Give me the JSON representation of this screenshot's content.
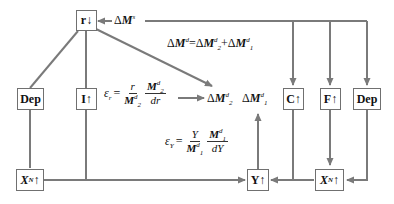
{
  "diagram": {
    "nodes": {
      "r": {
        "label": "r",
        "arrow": "↓"
      },
      "I": {
        "label": "I",
        "arrow": "↑"
      },
      "dep_left": {
        "label": "Dep"
      },
      "c": {
        "label": "C",
        "arrow": "↑"
      },
      "f": {
        "label": "F",
        "arrow": "↑"
      },
      "dep_right": {
        "label": "Dep"
      },
      "xn_left": {
        "label": "X",
        "sub": "N",
        "arrow": "↑"
      },
      "y": {
        "label": "Y",
        "arrow": "↑"
      },
      "xn_right": {
        "label": "X",
        "sub": "N",
        "arrow": "↑"
      }
    },
    "money_supply": {
      "delta": "Δ",
      "var": "M",
      "sup": "s"
    },
    "money_demand_equation": {
      "lhs_delta": "Δ",
      "lhs_var": "M",
      "lhs_sup": "d",
      "eq": "=",
      "t1_delta": "Δ",
      "t1_var": "M",
      "t1_sup": "d",
      "t1_sub": "2",
      "plus": "+",
      "t2_delta": "Δ",
      "t2_var": "M",
      "t2_sup": "d",
      "t2_sub": "1"
    },
    "demand_components": {
      "m2": {
        "delta": "Δ",
        "var": "M",
        "sup": "d",
        "sub": "2"
      },
      "m1": {
        "delta": "Δ",
        "var": "M",
        "sup": "d",
        "sub": "1"
      }
    },
    "elasticity_r": {
      "symbol": "ε",
      "sub": "r",
      "eq": "=",
      "f1_num": "r",
      "f1_den_var": "M",
      "f1_den_sup": "d",
      "f1_den_sub": "2",
      "f2_num_var": "M",
      "f2_num_sup": "d",
      "f2_num_sub": "2",
      "f2_den": "dr"
    },
    "elasticity_y": {
      "symbol": "ε",
      "sub": "Y",
      "eq": "=",
      "f1_num": "Y",
      "f1_den_var": "M",
      "f1_den_sup": "d",
      "f1_den_sub": "1",
      "f2_num_var": "M",
      "f2_num_sup": "d",
      "f2_num_sub": "1",
      "f2_den": "dY"
    },
    "colors": {
      "line": "#7a7a7a",
      "box_border": "#707070",
      "text": "#111111"
    }
  }
}
